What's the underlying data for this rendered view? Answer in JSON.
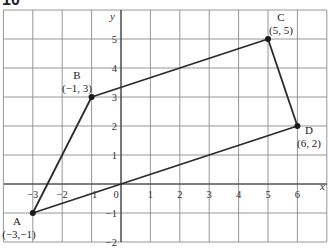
{
  "problem_number": "10",
  "axes": {
    "x_label": "x",
    "y_label": "y",
    "x_range": [
      -4,
      7
    ],
    "y_range": [
      -2,
      6
    ],
    "x_tick_labels": [
      "-3",
      "-2",
      "-1",
      "0",
      "1",
      "2",
      "3",
      "4",
      "5",
      "6"
    ],
    "y_tick_labels": [
      "5",
      "4",
      "3",
      "2",
      "1",
      "-1",
      "-2"
    ]
  },
  "points": [
    {
      "name": "A",
      "coords": "(−3,−1)",
      "x": -3,
      "y": -1
    },
    {
      "name": "B",
      "coords": "(−1, 3)",
      "x": -1,
      "y": 3
    },
    {
      "name": "C",
      "coords": "(5, 5)",
      "x": 5,
      "y": 5
    },
    {
      "name": "D",
      "coords": "(6, 2)",
      "x": 6,
      "y": 2
    }
  ],
  "edges": [
    [
      "A",
      "B"
    ],
    [
      "B",
      "C"
    ],
    [
      "C",
      "D"
    ],
    [
      "D",
      "A"
    ]
  ],
  "colors": {
    "grid": "#8a8a8a",
    "lines": "#2a2a2a",
    "background": "#ffffff"
  }
}
